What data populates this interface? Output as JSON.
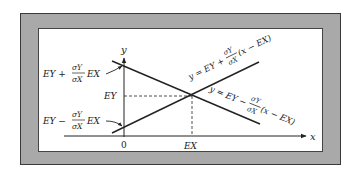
{
  "diagram": {
    "axes": {
      "x_label": "x",
      "y_label": "y",
      "origin_label": "0",
      "ex_label": "EX",
      "ey_label": "EY"
    },
    "left_labels": {
      "upper": {
        "prefix": "EY +",
        "frac_num": "σY",
        "frac_den": "σX",
        "suffix": "EX"
      },
      "lower": {
        "prefix": "EY −",
        "frac_num": "σY",
        "frac_den": "σX",
        "suffix": "EX"
      }
    },
    "lines": {
      "increasing": {
        "prefix": "y = EY +",
        "frac_num": "σY",
        "frac_den": "σX",
        "suffix": "(x − EX)"
      },
      "decreasing": {
        "prefix": "y = EY −",
        "frac_num": "σY",
        "frac_den": "σX",
        "suffix": "(x − EX)"
      }
    },
    "colors": {
      "frame": "#a9a9a9",
      "ink": "#222222",
      "background": "#ffffff"
    }
  }
}
